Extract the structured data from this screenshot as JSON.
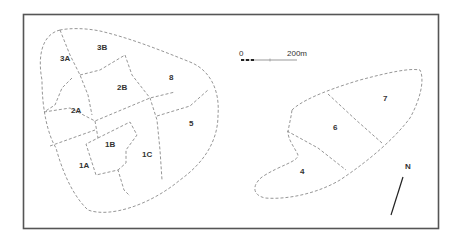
{
  "map": {
    "zones": [
      {
        "id": "3A",
        "x": 60,
        "y": 61
      },
      {
        "id": "3B",
        "x": 97,
        "y": 50
      },
      {
        "id": "8",
        "x": 169,
        "y": 80
      },
      {
        "id": "2B",
        "x": 117,
        "y": 90
      },
      {
        "id": "2A",
        "x": 71,
        "y": 113
      },
      {
        "id": "5",
        "x": 189,
        "y": 126
      },
      {
        "id": "1B",
        "x": 105,
        "y": 147
      },
      {
        "id": "1C",
        "x": 142,
        "y": 157
      },
      {
        "id": "1A",
        "x": 79,
        "y": 168
      },
      {
        "id": "7",
        "x": 383,
        "y": 101
      },
      {
        "id": "6",
        "x": 333,
        "y": 130
      },
      {
        "id": "4",
        "x": 300,
        "y": 174
      }
    ],
    "scale_bar": {
      "start_label": "0",
      "end_label": "200m"
    },
    "north_arrow": {
      "label": "N"
    },
    "colors": {
      "frame": "#555555",
      "boundary": "#8a8a8a",
      "text": "#333333"
    }
  }
}
